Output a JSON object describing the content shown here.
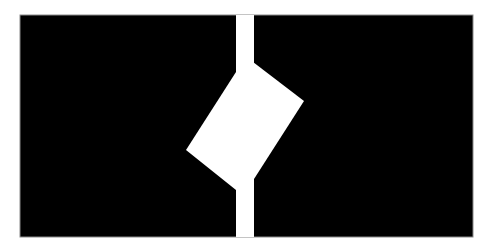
{
  "figure": {
    "background_color": "#ffffff",
    "panel": {
      "x": 20,
      "y": 15,
      "width": 453,
      "height": 222,
      "fill": "#000000",
      "border": "#8a8a8a"
    },
    "bar": {
      "x": 236,
      "y": 15,
      "width": 18,
      "height": 222,
      "fill": "#ffffff"
    },
    "tilted_rectangle": {
      "fill": "#ffffff",
      "points": "236,72 253,62 304,101 254,179 236,190 186,150"
    }
  }
}
